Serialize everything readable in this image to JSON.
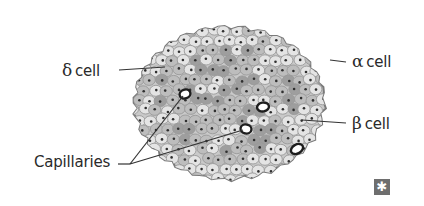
{
  "diagram": {
    "labels": {
      "delta": {
        "symbol": "δ",
        "text": "cell"
      },
      "alpha": {
        "symbol": "α",
        "text": "cell"
      },
      "beta": {
        "symbol": "β",
        "text": "cell"
      },
      "capillaries": {
        "text": "Capillaries"
      }
    },
    "badge_icon": {
      "name": "asterisk-icon",
      "glyph": "✱"
    },
    "colors": {
      "outline": "#7a7a7a",
      "membrane": "#9a9a9a",
      "cell_light": "#e4e4e4",
      "cell_mid": "#bdbdbd",
      "cell_dark": "#9e9e9e",
      "nucleus": "#2f2f2f",
      "capillary_wall": "#1e1e1e",
      "capillary_lumen": "#ffffff",
      "leader_line": "#333333",
      "badge_bg": "#6e6e6e"
    }
  }
}
